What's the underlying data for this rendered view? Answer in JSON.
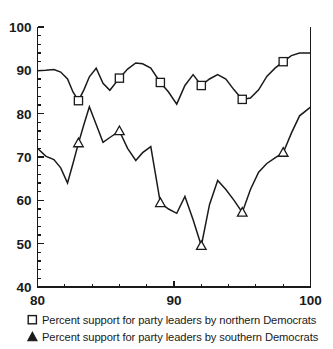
{
  "chart_data": {
    "type": "line",
    "title": "",
    "xlabel": "",
    "ylabel": "",
    "xlim": [
      80,
      100
    ],
    "ylim": [
      40,
      100
    ],
    "xticks": [
      80,
      90,
      100
    ],
    "yticks": [
      40,
      50,
      60,
      70,
      80,
      90,
      100
    ],
    "x_minor_step": 2,
    "y_minor_step": 2,
    "grid": false,
    "legend_position": "below-axes",
    "series": [
      {
        "name": "Percent support for party leaders by northern Democrats",
        "marker": "square",
        "marker_x": [
          83,
          86,
          89,
          92,
          95,
          98
        ],
        "x": [
          80,
          80.6,
          81.2,
          81.7,
          82.2,
          82.6,
          83,
          83.4,
          83.8,
          84.3,
          84.8,
          85.3,
          86,
          86.6,
          87.2,
          87.7,
          88.3,
          89,
          89.6,
          90.2,
          90.8,
          91.4,
          92,
          92.6,
          93.2,
          93.8,
          94.4,
          95,
          95.6,
          96.2,
          96.8,
          97.4,
          98,
          98.6,
          99.2,
          100
        ],
        "values": [
          89.9,
          90.0,
          90.2,
          89.6,
          88.0,
          85.0,
          83.0,
          85.5,
          88.5,
          90.5,
          87.0,
          85.4,
          88.2,
          90.3,
          91.7,
          91.5,
          90.5,
          87.2,
          85.0,
          82.2,
          86.5,
          89.0,
          86.5,
          88.0,
          89.0,
          88.0,
          85.5,
          83.3,
          83.6,
          85.5,
          88.6,
          90.5,
          92.0,
          93.4,
          94.0,
          94.0
        ]
      },
      {
        "name": "Percent support for party leaders by southern Democrats",
        "marker": "triangle",
        "marker_x": [
          83,
          86,
          89,
          92,
          95,
          98
        ],
        "x": [
          80,
          80.6,
          81.2,
          81.7,
          82.2,
          82.6,
          83,
          83.4,
          83.8,
          84.3,
          84.8,
          85.3,
          86,
          86.6,
          87.2,
          87.7,
          88.3,
          89,
          89.6,
          90.2,
          90.8,
          91.4,
          92,
          92.6,
          93.2,
          93.8,
          94.4,
          95,
          95.6,
          96.2,
          96.8,
          97.4,
          98,
          98.6,
          99.2,
          100
        ],
        "values": [
          72.0,
          70.2,
          69.4,
          67.5,
          64.0,
          68.5,
          73.2,
          77.5,
          81.6,
          77.5,
          73.4,
          74.5,
          76.0,
          72.0,
          69.2,
          71.0,
          72.4,
          59.4,
          58.0,
          57.0,
          60.9,
          55.5,
          49.5,
          59.0,
          64.6,
          62.5,
          60.0,
          57.2,
          62.5,
          66.5,
          68.5,
          69.8,
          71.0,
          75.5,
          79.5,
          81.5
        ]
      }
    ]
  },
  "legend": {
    "items": [
      {
        "marker": "square-icon",
        "label": "Percent support for party leaders by northern Democrats"
      },
      {
        "marker": "triangle-icon",
        "label": "Percent support for party leaders by southern Democrats"
      }
    ]
  },
  "colors": {
    "ink": "#1a1a1a",
    "background": "#ffffff",
    "marker_fill": "#ffffff"
  }
}
